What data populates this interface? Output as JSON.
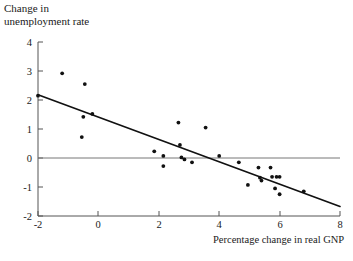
{
  "figure": {
    "ylabel": "Change in\nunemployment rate",
    "xlabel": "Percentage change in real GNP"
  },
  "chart_data": {
    "type": "scatter",
    "title": "",
    "xlabel": "Percentage change in real GNP",
    "ylabel": "Change in unemployment rate",
    "xlim": [
      -2,
      8
    ],
    "ylim": [
      -2,
      4
    ],
    "xticks": [
      -2,
      0,
      2,
      4,
      6,
      8
    ],
    "yticks": [
      -2,
      -1,
      0,
      1,
      2,
      3,
      4
    ],
    "xtick_labels": [
      "-2",
      "0",
      "2",
      "4",
      "6",
      "8"
    ],
    "ytick_labels": [
      "-2",
      "-1",
      "0",
      "1",
      "2",
      "3",
      "4"
    ],
    "grid": false,
    "legend": false,
    "marker_color": "#111111",
    "line_color": "#111111",
    "zero_line": {
      "y": 0,
      "color": "#555555",
      "description": "horizontal reference line at zero change in unemployment"
    },
    "series": [
      {
        "name": "Observations",
        "type": "scatter",
        "points": [
          [
            -2.0,
            2.15
          ],
          [
            -1.2,
            2.92
          ],
          [
            -0.45,
            2.55
          ],
          [
            -0.5,
            1.42
          ],
          [
            -0.2,
            1.52
          ],
          [
            -0.55,
            0.72
          ],
          [
            1.85,
            0.23
          ],
          [
            2.15,
            0.07
          ],
          [
            2.15,
            -0.28
          ],
          [
            2.65,
            1.22
          ],
          [
            2.7,
            0.45
          ],
          [
            2.75,
            0.02
          ],
          [
            2.85,
            -0.05
          ],
          [
            3.1,
            -0.15
          ],
          [
            3.55,
            1.05
          ],
          [
            4.0,
            0.07
          ],
          [
            4.65,
            -0.15
          ],
          [
            4.95,
            -0.93
          ],
          [
            5.3,
            -0.33
          ],
          [
            5.35,
            -0.68
          ],
          [
            5.4,
            -0.78
          ],
          [
            5.7,
            -0.33
          ],
          [
            5.75,
            -0.65
          ],
          [
            5.9,
            -0.65
          ],
          [
            6.0,
            -0.65
          ],
          [
            5.85,
            -1.05
          ],
          [
            6.0,
            -1.25
          ],
          [
            6.8,
            -1.15
          ]
        ]
      },
      {
        "name": "Regression line",
        "type": "line",
        "endpoints": [
          [
            -2.0,
            2.18
          ],
          [
            8.0,
            -1.67
          ]
        ],
        "slope": -0.385,
        "intercept": 1.41
      }
    ]
  }
}
